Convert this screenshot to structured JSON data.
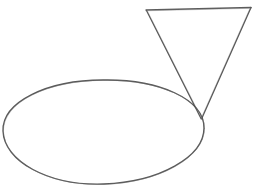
{
  "canvas": {
    "width": 258,
    "height": 196,
    "background_color": "#ffffff",
    "medium": "pencil-sketch",
    "title": "Hand-drawn ellipse and inverted triangle"
  },
  "ink": {
    "primary_stroke_color": "#4a4a4a",
    "secondary_stroke_color": "#6e6e6e",
    "stroke_width": 1.2
  },
  "shapes": [
    {
      "id": "ellipse",
      "name": "oval",
      "type": "ellipse",
      "center_x": 103,
      "center_y": 132,
      "radius_x": 101,
      "radius_y": 52,
      "rotation_deg": -1,
      "stroke_color": "#4a4a4a",
      "fill": "none"
    },
    {
      "id": "triangle",
      "name": "inverted-triangle",
      "type": "triangle",
      "orientation": "point-down",
      "vertices": [
        {
          "label": "top-left",
          "x": 146,
          "y": 10
        },
        {
          "label": "top-right",
          "x": 251,
          "y": 7
        },
        {
          "label": "apex-bottom",
          "x": 201,
          "y": 119
        }
      ],
      "stroke_color": "#4a4a4a",
      "fill": "none"
    }
  ],
  "relationships": [
    {
      "description": "triangle apex touches ellipse right edge",
      "point_x": 201,
      "point_y": 119
    }
  ],
  "paths": {
    "ellipse_outline": "M 204 128 C 204 157 159 182 104 184 C 48 186 4 161 3 131 C 2 102 47 80 103 80 C 159 79 204 99 204 128 Z",
    "triangle_left_edge": "M 146.5 10.5 L 201 118.5",
    "triangle_right_edge": "M 251 7.5 L 201.5 119",
    "triangle_top_edge": "M 146 10 L 251 7.5"
  }
}
